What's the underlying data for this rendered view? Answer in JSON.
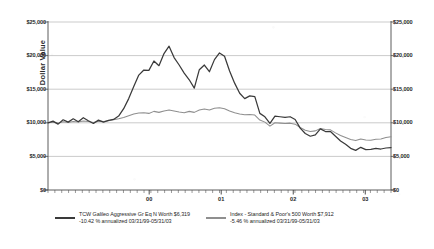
{
  "chart_data": {
    "type": "line",
    "title": "",
    "subtitle": "",
    "xlabel": "",
    "ylabel": "Dollar Value",
    "ylim": [
      0,
      25000
    ],
    "ytick_values": [
      0,
      5000,
      10000,
      15000,
      20000,
      25000
    ],
    "ytick_labels": [
      "$0",
      "$5,000",
      "$10,000",
      "$15,000",
      "$20,000",
      "$25,000"
    ],
    "ytick_labels_right": [
      "$0",
      "$5,000",
      "$10,000",
      "$15,000",
      "$20,000",
      "$25,000"
    ],
    "xtick_labels": [
      "00",
      "01",
      "02",
      "03"
    ],
    "xtick_positions": [
      0.295,
      0.505,
      0.715,
      0.925
    ],
    "grid": "horizontal",
    "legend_position": "bottom",
    "x_range_label": "03/31/99-05/31/03",
    "series": [
      {
        "name": "TCW Galileo Aggressive Gr Eq N",
        "legend_line1": "TCW Galileo Aggressive Gr Eq N Worth $6,319",
        "legend_line2": "-10.42 % annualized 03/31/99-05/31/03",
        "final_value": 6319,
        "annualized_return": -10.42,
        "color": "#3a3a3a",
        "values": [
          10000,
          10250,
          9800,
          10450,
          10100,
          10600,
          10150,
          10750,
          10300,
          9900,
          10400,
          10100,
          10350,
          10500,
          11000,
          12100,
          13600,
          15400,
          17100,
          17850,
          17800,
          19200,
          18500,
          20300,
          21400,
          19700,
          18600,
          17400,
          16400,
          15150,
          17900,
          18600,
          17600,
          19400,
          20400,
          19900,
          17700,
          15900,
          14400,
          13600,
          14000,
          13900,
          11400,
          10900,
          9900,
          11000,
          10900,
          10800,
          10900,
          10500,
          9200,
          8400,
          8000,
          8200,
          9100,
          8700,
          8700,
          8000,
          7300,
          6800,
          6200,
          5900,
          6350,
          6000,
          6050,
          6200,
          6100,
          6250,
          6319
        ]
      },
      {
        "name": "Index - Standard & Poor's 500",
        "legend_line1": "Index - Standard & Poor's 500 Worth $7,912",
        "legend_line2": "-5.46 % annualized 03/31/99-05/31/03",
        "final_value": 7912,
        "annualized_return": -5.46,
        "color": "#8f8f8f",
        "values": [
          10000,
          10080,
          9950,
          10150,
          10050,
          10200,
          10120,
          10280,
          10180,
          10050,
          10250,
          10180,
          10300,
          10450,
          10600,
          10800,
          11050,
          11300,
          11450,
          11500,
          11400,
          11700,
          11550,
          11750,
          11900,
          11750,
          11600,
          11500,
          11700,
          11550,
          11900,
          12050,
          11900,
          12150,
          12250,
          12100,
          11750,
          11500,
          11300,
          11200,
          11250,
          11150,
          10400,
          10100,
          9500,
          10000,
          9950,
          9900,
          9950,
          9800,
          9300,
          8900,
          8700,
          8800,
          9150,
          9000,
          8950,
          8500,
          8100,
          7800,
          7500,
          7350,
          7600,
          7450,
          7400,
          7550,
          7600,
          7800,
          7912
        ]
      }
    ]
  },
  "axis": {
    "left_title": "Dollar Value"
  }
}
